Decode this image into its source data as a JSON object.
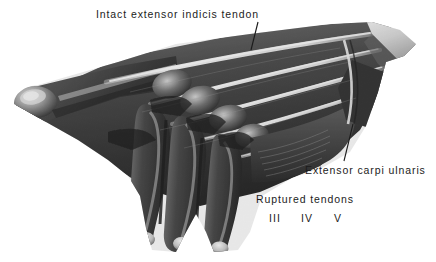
{
  "figure": {
    "kind": "anatomical-illustration",
    "background_color": "#ffffff",
    "ink_color": "#1c1c1c",
    "width": 436,
    "height": 262
  },
  "annotations": {
    "intact_tendon": {
      "text": "Intact extensor indicis tendon",
      "leader": {
        "x1": 258,
        "y1": 22,
        "x2": 251,
        "y2": 50
      }
    },
    "extensor_carpi_ulnaris": {
      "text": "Extensor carpi ulnaris",
      "leader": {
        "x1": 353,
        "y1": 124,
        "x2": 344,
        "y2": 161
      }
    },
    "ruptured_tendons": {
      "text": "Ruptured tendons"
    }
  },
  "tendon_numerals": [
    {
      "label": "III"
    },
    {
      "label": "IV"
    },
    {
      "label": "V"
    }
  ]
}
